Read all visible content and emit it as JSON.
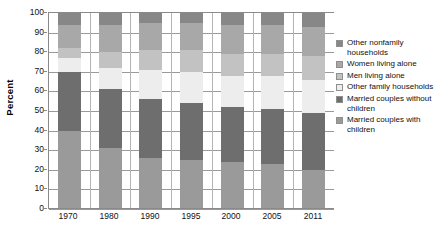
{
  "chart_data": {
    "type": "bar",
    "subtype": "stacked-bar-100",
    "title": "",
    "xlabel": "",
    "ylabel": "Percent",
    "ylim": [
      0,
      100
    ],
    "ytick_step": 10,
    "yticks": [
      100,
      90,
      80,
      70,
      60,
      50,
      40,
      30,
      20,
      10,
      0
    ],
    "grid": true,
    "legend_position": "right",
    "categories": [
      "1970",
      "1980",
      "1990",
      "1995",
      "2000",
      "2005",
      "2011"
    ],
    "series": [
      {
        "name": "Married couples with children",
        "color": "#9a9a9a",
        "values": [
          40,
          31,
          26,
          25,
          24,
          23,
          20
        ]
      },
      {
        "name": "Married couples without children",
        "color": "#6e6e6e",
        "values": [
          30,
          30,
          30,
          29,
          28,
          28,
          29
        ]
      },
      {
        "name": "Other family households",
        "color": "#ededed",
        "values": [
          7,
          11,
          15,
          16,
          16,
          17,
          17
        ]
      },
      {
        "name": "Men living alone",
        "color": "#c2c2c2",
        "values": [
          5,
          8,
          10,
          11,
          11,
          11,
          12
        ]
      },
      {
        "name": "Women living alone",
        "color": "#a8a8a8",
        "values": [
          12,
          14,
          14,
          14,
          15,
          15,
          15
        ]
      },
      {
        "name": "Other nonfamily households",
        "color": "#878787",
        "values": [
          6,
          6,
          5,
          5,
          6,
          6,
          7
        ]
      }
    ]
  },
  "legend": {
    "items": [
      {
        "label": "Other nonfamily households",
        "color": "#878787"
      },
      {
        "label": "Women living alone",
        "color": "#a8a8a8"
      },
      {
        "label": "Men living alone",
        "color": "#c2c2c2"
      },
      {
        "label": "Other family households",
        "color": "#ededed"
      },
      {
        "label": "Married couples without children",
        "color": "#6e6e6e"
      },
      {
        "label": "Married couples with children",
        "color": "#9a9a9a"
      }
    ]
  },
  "axis": {
    "y_title": "Percent"
  }
}
